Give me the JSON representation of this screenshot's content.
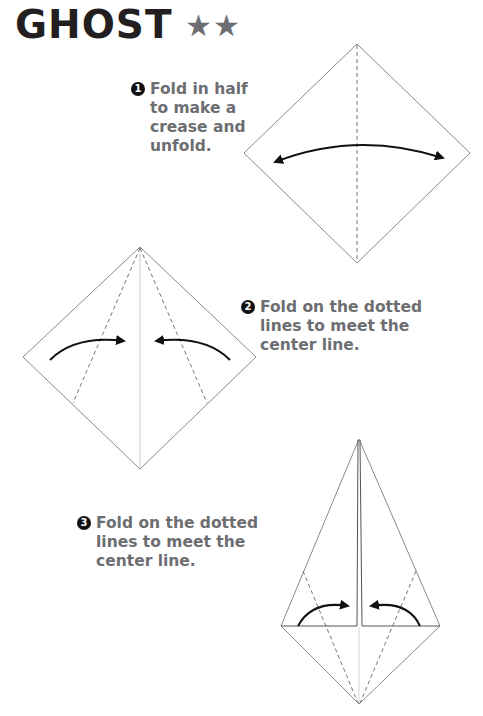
{
  "header": {
    "title": "GHOST",
    "difficulty_stars": "★★",
    "difficulty_level": 2
  },
  "steps": [
    {
      "number": "1",
      "lines": [
        "Fold in half",
        "to make a",
        "crease and",
        "unfold."
      ]
    },
    {
      "number": "2",
      "lines": [
        "Fold on the dotted",
        "lines to meet the",
        "center line."
      ]
    },
    {
      "number": "3",
      "lines": [
        "Fold on the dotted",
        "lines to meet the",
        "center line."
      ]
    }
  ],
  "colors": {
    "title": "#231f20",
    "step_text": "#6d6e71",
    "stars": "#6d6e71",
    "paper_edge": "#8a8a8a",
    "arrow": "#111111"
  }
}
